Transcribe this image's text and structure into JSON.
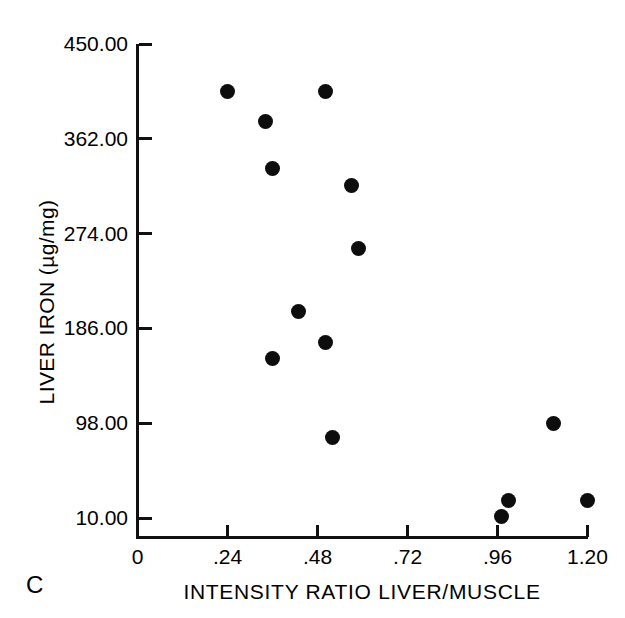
{
  "panel": {
    "label": "C"
  },
  "chart_data": {
    "type": "scatter",
    "title": "",
    "xlabel": "INTENSITY RATIO LIVER/MUSCLE",
    "ylabel": "LIVER IRON (µg/mg)",
    "xlim": [
      0,
      1.2
    ],
    "ylim": [
      10.0,
      450.0
    ],
    "grid": false,
    "legend": null,
    "xticks": [
      0,
      0.24,
      0.48,
      0.72,
      0.96,
      1.2
    ],
    "xticklabels": [
      "0",
      ".24",
      ".48",
      ".72",
      ".96",
      "1.20"
    ],
    "yticks": [
      10.0,
      98.0,
      186.0,
      274.0,
      362.0,
      450.0
    ],
    "yticklabels": [
      "10.00",
      "98.00",
      "186.00",
      "274.00",
      "362.00",
      "450.00"
    ],
    "marker": "filled-circle",
    "marker_color": "#0d0d0d",
    "points": [
      {
        "x": 0.24,
        "y": 406
      },
      {
        "x": 0.34,
        "y": 378
      },
      {
        "x": 0.5,
        "y": 406
      },
      {
        "x": 0.36,
        "y": 334
      },
      {
        "x": 0.57,
        "y": 319
      },
      {
        "x": 0.59,
        "y": 260
      },
      {
        "x": 0.43,
        "y": 202
      },
      {
        "x": 0.5,
        "y": 173
      },
      {
        "x": 0.36,
        "y": 158
      },
      {
        "x": 0.52,
        "y": 85
      },
      {
        "x": 1.11,
        "y": 98
      },
      {
        "x": 0.99,
        "y": 26
      },
      {
        "x": 0.97,
        "y": 11
      },
      {
        "x": 1.2,
        "y": 26
      }
    ]
  }
}
